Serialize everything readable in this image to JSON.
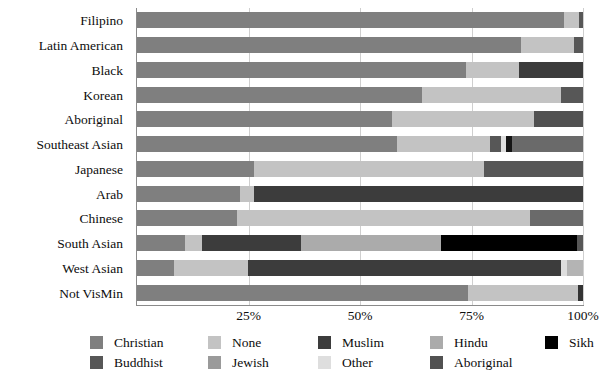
{
  "chart_data": {
    "type": "bar",
    "orientation": "horizontal",
    "stacked": true,
    "normalized": true,
    "title": "",
    "subtitle": "",
    "xlabel": "",
    "ylabel": "",
    "xlim": [
      0,
      100
    ],
    "grid": true,
    "grid_axis": "x",
    "legend_position": "bottom",
    "xticks": [
      {
        "value": 25,
        "label": "25%"
      },
      {
        "value": 50,
        "label": "50%"
      },
      {
        "value": 75,
        "label": "75%"
      },
      {
        "value": 100,
        "label": "100%"
      }
    ],
    "categories": [
      "Filipino",
      "Latin American",
      "Black",
      "Korean",
      "Aboriginal",
      "Southeast Asian",
      "Japanese",
      "Arab",
      "Chinese",
      "South Asian",
      "West Asian",
      "Not VisMin"
    ],
    "series": [
      {
        "name": "Christian",
        "color": "#7f7f7f",
        "values": [
          95.8,
          86.2,
          73.8,
          64.0,
          57.2,
          58.3,
          26.2,
          23.1,
          22.4,
          10.8,
          8.3,
          74.2
        ]
      },
      {
        "name": "None",
        "color": "#c3c3c3",
        "values": [
          3.2,
          11.8,
          11.8,
          31.0,
          31.8,
          20.8,
          51.6,
          3.1,
          65.8,
          3.8,
          16.5,
          24.6
        ]
      },
      {
        "name": "Jewish",
        "color": "#9a9a9a",
        "values": [
          0,
          0,
          0,
          0,
          0,
          0,
          0,
          0,
          0,
          0,
          0,
          0
        ]
      },
      {
        "name": "Muslim",
        "color": "#3c3c3c",
        "values": [
          0,
          0,
          14.4,
          0,
          0,
          1.3,
          0,
          73.8,
          0,
          22.1,
          70.2,
          0
        ]
      },
      {
        "name": "Other",
        "color": "#dedede",
        "values": [
          0,
          0,
          0,
          0,
          0,
          0,
          0,
          0,
          0,
          0,
          0,
          0
        ]
      },
      {
        "name": "Hindu",
        "color": "#ababab",
        "values": [
          0,
          0,
          0,
          0,
          0,
          0,
          0,
          0,
          0,
          31.4,
          0,
          0
        ]
      },
      {
        "name": "Sikh",
        "color": "#000000",
        "values": [
          0,
          0,
          0,
          0,
          0,
          0,
          0,
          0,
          0,
          30.6,
          0,
          0
        ]
      },
      {
        "name": "Buddhist",
        "color": "#575757",
        "values": [
          1.0,
          2.0,
          0,
          5.0,
          0,
          19.6,
          22.2,
          0,
          11.8,
          1.3,
          1.5,
          1.2
        ]
      },
      {
        "name": "Aboriginal",
        "color": "#515151",
        "values": [
          0,
          0,
          0,
          0,
          11.0,
          0,
          0,
          0,
          0,
          0,
          3.5,
          0
        ]
      }
    ],
    "stack_order_per_bar": [
      [
        "Christian",
        "None",
        "Buddhist"
      ],
      [
        "Christian",
        "None",
        "Buddhist"
      ],
      [
        "Christian",
        "None",
        "Muslim"
      ],
      [
        "Christian",
        "None",
        "Buddhist"
      ],
      [
        "Christian",
        "None",
        "Aboriginal"
      ],
      [
        "Christian",
        "None",
        "Buddhist",
        "Muslim",
        "Buddhist"
      ],
      [
        "Christian",
        "None",
        "Buddhist"
      ],
      [
        "Christian",
        "None",
        "Muslim"
      ],
      [
        "Christian",
        "None",
        "Buddhist"
      ],
      [
        "Christian",
        "None",
        "Muslim",
        "Hindu",
        "Sikh",
        "Buddhist"
      ],
      [
        "Christian",
        "None",
        "Muslim",
        "Buddhist",
        "Aboriginal"
      ],
      [
        "Christian",
        "None",
        "Buddhist"
      ]
    ]
  },
  "bars": [
    {
      "category": "Filipino",
      "segments": [
        {
          "series": "Christian",
          "value": 95.8,
          "color": "#7f7f7f"
        },
        {
          "series": "None",
          "value": 3.2,
          "color": "#c3c3c3"
        },
        {
          "series": "Buddhist",
          "value": 1.0,
          "color": "#575757"
        }
      ]
    },
    {
      "category": "Latin American",
      "segments": [
        {
          "series": "Christian",
          "value": 86.2,
          "color": "#7f7f7f"
        },
        {
          "series": "None",
          "value": 11.8,
          "color": "#c3c3c3"
        },
        {
          "series": "Buddhist",
          "value": 2.0,
          "color": "#575757"
        }
      ]
    },
    {
      "category": "Black",
      "segments": [
        {
          "series": "Christian",
          "value": 73.8,
          "color": "#7f7f7f"
        },
        {
          "series": "None",
          "value": 11.8,
          "color": "#c3c3c3"
        },
        {
          "series": "Muslim",
          "value": 14.4,
          "color": "#3c3c3c"
        }
      ]
    },
    {
      "category": "Korean",
      "segments": [
        {
          "series": "Christian",
          "value": 64.0,
          "color": "#7f7f7f"
        },
        {
          "series": "None",
          "value": 31.0,
          "color": "#c3c3c3"
        },
        {
          "series": "Buddhist",
          "value": 5.0,
          "color": "#575757"
        }
      ]
    },
    {
      "category": "Aboriginal",
      "segments": [
        {
          "series": "Christian",
          "value": 57.2,
          "color": "#7f7f7f"
        },
        {
          "series": "None",
          "value": 31.8,
          "color": "#c3c3c3"
        },
        {
          "series": "Aboriginal",
          "value": 11.0,
          "color": "#515151"
        }
      ]
    },
    {
      "category": "Southeast Asian",
      "segments": [
        {
          "series": "Christian",
          "value": 58.3,
          "color": "#7f7f7f"
        },
        {
          "series": "None",
          "value": 20.8,
          "color": "#c3c3c3"
        },
        {
          "series": "Buddhist",
          "value": 2.6,
          "color": "#575757"
        },
        {
          "series": "Other",
          "value": 1.0,
          "color": "#dedede"
        },
        {
          "series": "Muslim",
          "value": 1.3,
          "color": "#151515"
        },
        {
          "series": "Buddhist",
          "value": 16.0,
          "color": "#6a6a6a"
        }
      ]
    },
    {
      "category": "Japanese",
      "segments": [
        {
          "series": "Christian",
          "value": 26.2,
          "color": "#7f7f7f"
        },
        {
          "series": "None",
          "value": 51.6,
          "color": "#c3c3c3"
        },
        {
          "series": "Buddhist",
          "value": 22.2,
          "color": "#575757"
        }
      ]
    },
    {
      "category": "Arab",
      "segments": [
        {
          "series": "Christian",
          "value": 23.1,
          "color": "#7f7f7f"
        },
        {
          "series": "None",
          "value": 3.1,
          "color": "#c3c3c3"
        },
        {
          "series": "Muslim",
          "value": 73.8,
          "color": "#3c3c3c"
        }
      ]
    },
    {
      "category": "Chinese",
      "segments": [
        {
          "series": "Christian",
          "value": 22.4,
          "color": "#7f7f7f"
        },
        {
          "series": "None",
          "value": 65.8,
          "color": "#c3c3c3"
        },
        {
          "series": "Buddhist",
          "value": 11.8,
          "color": "#6a6a6a"
        }
      ]
    },
    {
      "category": "South Asian",
      "segments": [
        {
          "series": "Christian",
          "value": 10.8,
          "color": "#7f7f7f"
        },
        {
          "series": "None",
          "value": 3.8,
          "color": "#c3c3c3"
        },
        {
          "series": "Muslim",
          "value": 22.1,
          "color": "#3c3c3c"
        },
        {
          "series": "Hindu",
          "value": 31.4,
          "color": "#ababab"
        },
        {
          "series": "Sikh",
          "value": 30.6,
          "color": "#000000"
        },
        {
          "series": "Buddhist",
          "value": 1.3,
          "color": "#575757"
        }
      ]
    },
    {
      "category": "West Asian",
      "segments": [
        {
          "series": "Christian",
          "value": 8.3,
          "color": "#7f7f7f"
        },
        {
          "series": "None",
          "value": 16.5,
          "color": "#c3c3c3"
        },
        {
          "series": "Muslim",
          "value": 70.2,
          "color": "#3c3c3c"
        },
        {
          "series": "Other",
          "value": 1.5,
          "color": "#dedede"
        },
        {
          "series": "Aboriginal",
          "value": 3.5,
          "color": "#b4b4b4"
        }
      ]
    },
    {
      "category": "Not VisMin",
      "segments": [
        {
          "series": "Christian",
          "value": 74.2,
          "color": "#7f7f7f"
        },
        {
          "series": "None",
          "value": 24.6,
          "color": "#c3c3c3"
        },
        {
          "series": "Buddhist",
          "value": 1.2,
          "color": "#333333"
        }
      ]
    }
  ],
  "legend": {
    "items": [
      {
        "label": "Christian",
        "color": "#7f7f7f",
        "col": 0,
        "row": 0
      },
      {
        "label": "Buddhist",
        "color": "#575757",
        "col": 0,
        "row": 1
      },
      {
        "label": "None",
        "color": "#c3c3c3",
        "col": 1,
        "row": 0
      },
      {
        "label": "Jewish",
        "color": "#9a9a9a",
        "col": 1,
        "row": 1
      },
      {
        "label": "Muslim",
        "color": "#3c3c3c",
        "col": 2,
        "row": 0
      },
      {
        "label": "Other",
        "color": "#dedede",
        "col": 2,
        "row": 1
      },
      {
        "label": "Hindu",
        "color": "#ababab",
        "col": 3,
        "row": 0
      },
      {
        "label": "Aboriginal",
        "color": "#515151",
        "col": 3,
        "row": 1
      },
      {
        "label": "Sikh",
        "color": "#000000",
        "col": 4,
        "row": 0
      }
    ]
  },
  "axis": {
    "left_color": "#8a8a8a",
    "grid_color": "#cfcfcf"
  }
}
